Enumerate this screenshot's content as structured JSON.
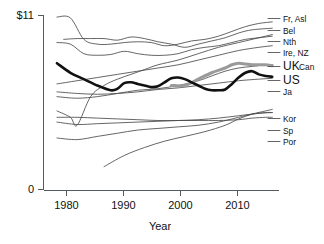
{
  "chart_data": {
    "type": "line",
    "title": "",
    "xlabel": "Year",
    "ylabel": "",
    "xlim": [
      1979,
      2014
    ],
    "ylim": [
      0,
      11
    ],
    "grid": false,
    "legend_position": "right-of-plot",
    "y_ticks": [
      {
        "value": 11,
        "label": "$11"
      },
      {
        "value": 0,
        "label": "0"
      }
    ],
    "x_ticks": [
      {
        "value": 1980,
        "label": "1980"
      },
      {
        "value": 1990,
        "label": "1990"
      },
      {
        "value": 2000,
        "label": "2000"
      },
      {
        "value": 2010,
        "label": "2010"
      }
    ],
    "highlight_colors": {
      "us": "#111111",
      "uk": "#9a9a9a",
      "other": "#4a4a4a"
    },
    "series": [
      {
        "name": "Fr, Asl",
        "label": "Fr, Asl",
        "style": "thin",
        "x": [
          1981,
          1983,
          1985,
          1987,
          1989,
          1991,
          1993,
          1995,
          1997,
          1999,
          2001,
          2003,
          2005,
          2007,
          2009,
          2011,
          2013
        ],
        "values": [
          10.9,
          10.85,
          9.5,
          9.2,
          9.2,
          9.3,
          9.35,
          9.3,
          9.1,
          9.2,
          9.4,
          9.5,
          9.7,
          10.0,
          10.3,
          10.5,
          10.6
        ]
      },
      {
        "name": "Bel",
        "label": "Bel",
        "style": "thin",
        "x": [
          1982,
          1984,
          1986,
          1988,
          1990,
          1992,
          1994,
          1996,
          1998,
          2000,
          2002,
          2004,
          2006,
          2008,
          2010,
          2013
        ],
        "values": [
          9.5,
          9.55,
          9.55,
          9.55,
          9.45,
          9.65,
          9.55,
          9.35,
          9.2,
          9.0,
          9.2,
          9.4,
          9.6,
          9.9,
          10.1,
          10.2
        ]
      },
      {
        "name": "Nth",
        "label": "Nth",
        "style": "thin",
        "x": [
          1981,
          1983,
          1985,
          1987,
          1989,
          1991,
          1993,
          1995,
          1997,
          1999,
          2001,
          2003,
          2005,
          2007,
          2009,
          2011,
          2013
        ],
        "values": [
          9.3,
          9.2,
          8.6,
          8.5,
          8.55,
          8.75,
          8.6,
          8.5,
          8.5,
          8.6,
          8.85,
          9.0,
          9.1,
          9.3,
          9.5,
          9.6,
          9.7
        ]
      },
      {
        "name": "Ire, NZ",
        "label": "Ire, NZ",
        "style": "thin",
        "x": [
          1981,
          1984,
          1987,
          1990,
          1993,
          1996,
          1999,
          2002,
          2005,
          2008,
          2011,
          2013
        ],
        "values": [
          6.7,
          6.9,
          7.1,
          7.3,
          7.5,
          7.7,
          7.9,
          8.2,
          8.5,
          8.8,
          9.0,
          9.1
        ]
      },
      {
        "name": "UK",
        "label": "UK",
        "style": "hl-uk",
        "x": [
          1998,
          2000,
          2002,
          2004,
          2006,
          2007,
          2008,
          2009,
          2010,
          2011,
          2012,
          2013
        ],
        "values": [
          6.6,
          6.6,
          7.0,
          7.4,
          7.7,
          7.9,
          8.0,
          7.95,
          7.9,
          7.9,
          7.9,
          7.85
        ]
      },
      {
        "name": "Can",
        "label": "Can",
        "style": "thin",
        "x": [
          1981,
          1984,
          1987,
          1990,
          1993,
          1996,
          1999,
          2002,
          2004,
          2006,
          2008,
          2010,
          2012,
          2013
        ],
        "values": [
          5.9,
          5.8,
          5.9,
          6.1,
          6.3,
          6.4,
          6.6,
          6.9,
          7.2,
          7.5,
          7.7,
          7.8,
          7.9,
          7.9
        ]
      },
      {
        "name": "US",
        "label": "US",
        "style": "hl-us",
        "x": [
          1981,
          1983,
          1985,
          1987,
          1989,
          1990,
          1991,
          1992,
          1993,
          1994,
          1995,
          1996,
          1997,
          1998,
          1999,
          2000,
          2001,
          2002,
          2003,
          2004,
          2005,
          2006,
          2007,
          2008,
          2009,
          2010,
          2011,
          2012,
          2013
        ],
        "values": [
          8.0,
          7.4,
          7.0,
          6.6,
          6.3,
          6.4,
          6.75,
          6.8,
          6.7,
          6.6,
          6.5,
          6.55,
          6.8,
          7.05,
          7.1,
          7.0,
          6.8,
          6.6,
          6.4,
          6.3,
          6.3,
          6.35,
          6.7,
          7.1,
          7.4,
          7.5,
          7.3,
          7.2,
          7.15
        ]
      },
      {
        "name": "Ja",
        "label": "Ja",
        "style": "thin",
        "x": [
          1981,
          1984,
          1987,
          1990,
          1993,
          1996,
          1999,
          2002,
          2005,
          2008,
          2011,
          2013
        ],
        "values": [
          6.2,
          6.1,
          6.05,
          6.1,
          6.2,
          6.35,
          6.45,
          6.6,
          6.75,
          6.9,
          7.0,
          7.05
        ]
      },
      {
        "name": "Kor",
        "label": "Kor",
        "style": "thin",
        "x": [
          1988,
          1991,
          1994,
          1997,
          2000,
          2003,
          2006,
          2008,
          2010,
          2012,
          2013
        ],
        "values": [
          1.5,
          2.2,
          2.7,
          3.1,
          3.4,
          3.7,
          4.1,
          4.5,
          4.8,
          5.0,
          5.1
        ]
      },
      {
        "name": "Sp",
        "label": "Sp",
        "style": "thin",
        "x": [
          1981,
          1984,
          1987,
          1990,
          1993,
          1996,
          1999,
          2002,
          2005,
          2008,
          2010,
          2012,
          2013
        ],
        "values": [
          3.3,
          3.2,
          3.4,
          3.6,
          3.8,
          3.9,
          4.0,
          4.1,
          4.3,
          4.6,
          4.8,
          4.9,
          4.9
        ]
      },
      {
        "name": "Por",
        "label": "Por",
        "style": "thin",
        "x": [
          1981,
          1984,
          1987,
          1990,
          1993,
          1996,
          1999,
          2002,
          2005,
          2008,
          2010,
          2012,
          2013
        ],
        "values": [
          4.6,
          4.6,
          4.55,
          4.5,
          4.45,
          4.4,
          4.4,
          4.4,
          4.4,
          4.45,
          4.55,
          4.6,
          4.6
        ]
      },
      {
        "name": "Nor-upper",
        "label": "",
        "style": "thin",
        "x": [
          1981,
          1983,
          1984,
          1986,
          1988,
          1990,
          1992,
          1994,
          1996,
          1999,
          2002,
          2005,
          2008,
          2011,
          2013
        ],
        "values": [
          5.0,
          4.6,
          4.1,
          5.9,
          6.6,
          7.0,
          7.3,
          7.6,
          7.9,
          8.2,
          8.6,
          9.0,
          9.3,
          9.6,
          9.8
        ]
      },
      {
        "name": "Lower-band",
        "label": "",
        "style": "thin",
        "x": [
          1981,
          1984,
          1987,
          1990,
          1993,
          1996,
          1999,
          2002,
          2005,
          2008,
          2011,
          2013
        ],
        "values": [
          4.3,
          4.15,
          4.2,
          4.25,
          4.3,
          4.35,
          4.4,
          4.45,
          4.55,
          4.7,
          4.85,
          4.9
        ]
      }
    ],
    "legend_entries": [
      {
        "label": "Fr, Asl",
        "size": "small"
      },
      {
        "label": "Bel",
        "size": "small"
      },
      {
        "label": "Nth",
        "size": "small"
      },
      {
        "label": "Ire, NZ",
        "size": "small"
      },
      {
        "label": "UK",
        "size": "large"
      },
      {
        "label": "Can",
        "size": "small"
      },
      {
        "label": "US",
        "size": "large"
      },
      {
        "label": "Ja",
        "size": "small"
      },
      {
        "label": "Kor",
        "size": "small"
      },
      {
        "label": "Sp",
        "size": "small"
      },
      {
        "label": "Por",
        "size": "small"
      }
    ]
  }
}
